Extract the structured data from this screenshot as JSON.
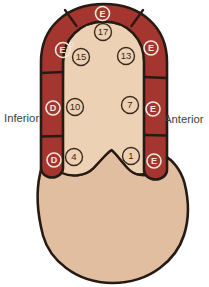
{
  "diagram": {
    "side_labels": {
      "inferior": "Inferior",
      "anterior": "Anterior"
    },
    "wall_markers": [
      {
        "id": "apex",
        "label": "E",
        "superscript": ""
      },
      {
        "id": "apical-inferior",
        "label": "E",
        "superscript": "D"
      },
      {
        "id": "apical-anterior",
        "label": "E",
        "superscript": ""
      },
      {
        "id": "mid-inferior",
        "label": "D",
        "superscript": ""
      },
      {
        "id": "mid-anterior",
        "label": "E",
        "superscript": ""
      },
      {
        "id": "basal-inferior",
        "label": "D",
        "superscript": ""
      },
      {
        "id": "basal-anterior",
        "label": "E",
        "superscript": ""
      }
    ],
    "segment_numbers": [
      {
        "id": "apex",
        "value": "17"
      },
      {
        "id": "apical-inferior",
        "value": "15"
      },
      {
        "id": "apical-anterior",
        "value": "13"
      },
      {
        "id": "mid-inferior",
        "value": "10"
      },
      {
        "id": "mid-anterior",
        "value": "7"
      },
      {
        "id": "basal-inferior",
        "value": "4"
      },
      {
        "id": "basal-anterior",
        "value": "1"
      }
    ],
    "colors": {
      "wall_red": "#a5362f",
      "outline_dark": "#261b14",
      "cavity_tan": "#edd1b4",
      "chamber_tan": "#e2bea1",
      "marker_white": "#f6e7de",
      "label_text": "#3e3e3e",
      "background": "#ffffff"
    }
  }
}
